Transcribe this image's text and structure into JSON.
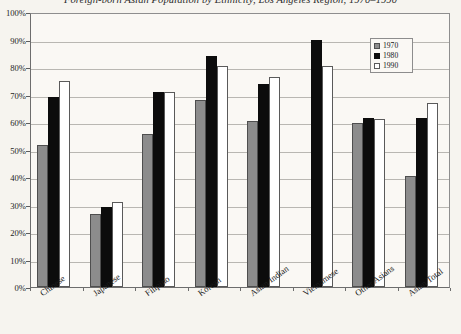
{
  "chart_data": {
    "type": "bar",
    "title": "Foreign-born Asian Population by Ethnicity, Los Angeles Region, 1970–1990",
    "xlabel": "",
    "ylabel": "",
    "ylim": [
      0,
      100
    ],
    "ytick_labels": [
      "100%",
      "90%",
      "80%",
      "70%",
      "60%",
      "50%",
      "40%",
      "30%",
      "20%",
      "10%",
      "0%"
    ],
    "ytick_values": [
      100,
      90,
      80,
      70,
      60,
      50,
      40,
      30,
      20,
      10,
      0
    ],
    "grid": true,
    "legend_position": "top-right",
    "categories": [
      "Chinese",
      "Japanese",
      "Filipino",
      "Korean",
      "Asian Indian",
      "Vietnamese",
      "Other Asians",
      "Asian Total"
    ],
    "series": [
      {
        "name": "1970",
        "color": "#8c8c8c",
        "values": [
          51.5,
          26.5,
          55.5,
          68.0,
          60.5,
          null,
          59.5,
          40.5
        ]
      },
      {
        "name": "1980",
        "color": "#0c0c0c",
        "values": [
          69.0,
          29.0,
          71.0,
          84.0,
          74.0,
          90.0,
          61.5,
          61.5
        ]
      },
      {
        "name": "1990",
        "color": "#ffffff",
        "values": [
          75.0,
          31.0,
          71.0,
          80.5,
          76.5,
          80.5,
          61.0,
          67.0
        ]
      }
    ]
  },
  "legend": {
    "items": [
      {
        "label": "1970"
      },
      {
        "label": "1980"
      },
      {
        "label": "1990"
      }
    ]
  },
  "colors": {
    "background": "#f6f4ef",
    "plot_background": "#faf8f4",
    "gridline": "#b9b7b2",
    "axis": "#6d6d6d",
    "text": "#1c1c1c"
  }
}
